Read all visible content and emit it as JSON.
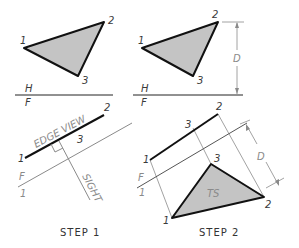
{
  "colors": {
    "triangle_fill": "#c4c4c4",
    "edge_stroke": "#111111",
    "construction_stroke": "#8a8a8a",
    "label_text": "#3a3a3a",
    "background": "#ffffff"
  },
  "step1": {
    "caption": "STEP 1",
    "top_view": {
      "vertex_labels": {
        "p1": "1",
        "p2": "2",
        "p3": "3"
      },
      "fold_labels": {
        "upper": "H",
        "lower": "F"
      }
    },
    "aux_view": {
      "vertex_labels": {
        "p1": "1",
        "p2": "2",
        "p3": "3"
      },
      "edge_view_label": "EDGE VIEW",
      "sight_label": "SIGHT",
      "fold_labels": {
        "upper": "F",
        "lower": "1"
      }
    }
  },
  "step2": {
    "caption": "STEP 2",
    "top_view": {
      "vertex_labels": {
        "p1": "1",
        "p2": "2",
        "p3": "3"
      },
      "fold_labels": {
        "upper": "H",
        "lower": "F"
      },
      "dimension_label": "D"
    },
    "aux_view": {
      "edge_vertex_labels": {
        "p1": "1",
        "p2": "2",
        "p3": "3"
      },
      "fold_labels": {
        "upper": "F",
        "lower": "1"
      },
      "true_shape_labels": {
        "p1": "1",
        "p2": "2",
        "p3": "3"
      },
      "true_shape_label": "TS",
      "dimension_label": "D"
    }
  }
}
